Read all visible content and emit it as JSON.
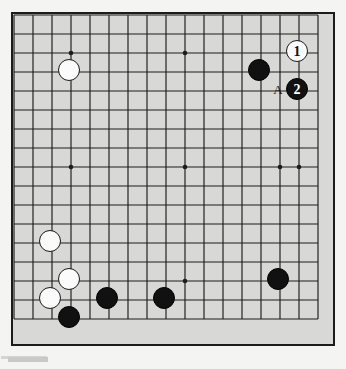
{
  "figure": {
    "board_background": "#d8d8d6",
    "page_background": "#f4f4f2",
    "line_color": "#1c1c1c",
    "black_color": "#111111",
    "white_color": "#fbfbfb"
  },
  "board": {
    "visible_columns": 17,
    "visible_rows": 17,
    "cell_size": 19,
    "origin_x": 12,
    "origin_y": 13,
    "star_points": [
      {
        "col": 3,
        "row": 2
      },
      {
        "col": 3,
        "row": 8
      },
      {
        "col": 9,
        "row": 2
      },
      {
        "col": 9,
        "row": 8
      },
      {
        "col": 9,
        "row": 14
      },
      {
        "col": 15,
        "row": 2
      },
      {
        "col": 15,
        "row": 8
      },
      {
        "col": 14,
        "row": 8
      }
    ]
  },
  "stones": [
    {
      "id": "w-upper-left",
      "color": "white",
      "col": 3,
      "row": 3,
      "label": ""
    },
    {
      "id": "b-upper-right",
      "color": "black",
      "col": 13,
      "row": 3,
      "label": ""
    },
    {
      "id": "w-move-1",
      "color": "white",
      "col": 15,
      "row": 2,
      "label": "1"
    },
    {
      "id": "b-move-2",
      "color": "black",
      "col": 15,
      "row": 4,
      "label": "2"
    },
    {
      "id": "w-left-upper",
      "color": "white",
      "col": 2,
      "row": 12,
      "label": ""
    },
    {
      "id": "w-left-mid",
      "color": "white",
      "col": 3,
      "row": 14,
      "label": ""
    },
    {
      "id": "w-left-lower",
      "color": "white",
      "col": 2,
      "row": 15,
      "label": ""
    },
    {
      "id": "b-left-bottom",
      "color": "black",
      "col": 3,
      "row": 16,
      "label": ""
    },
    {
      "id": "b-bottom-a",
      "color": "black",
      "col": 5,
      "row": 15,
      "label": ""
    },
    {
      "id": "b-bottom-b",
      "color": "black",
      "col": 8,
      "row": 15,
      "label": ""
    },
    {
      "id": "b-right-bottom",
      "color": "black",
      "col": 14,
      "row": 14,
      "label": ""
    }
  ],
  "markers": [
    {
      "id": "marker-a",
      "text": "A",
      "col": 14,
      "row": 4
    }
  ],
  "move_labels": {
    "white_one": "1",
    "black_two": "2",
    "point_a": "A"
  }
}
